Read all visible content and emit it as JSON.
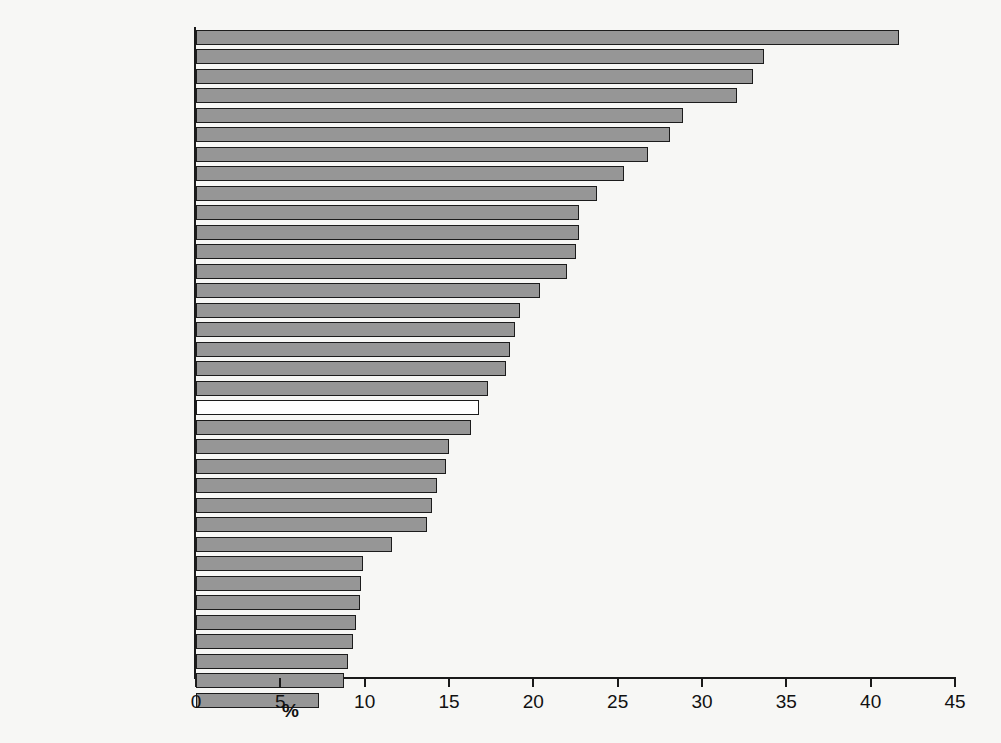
{
  "chart_data": {
    "type": "bar",
    "orientation": "horizontal",
    "title": "",
    "subtitle": "",
    "xlabel": "%",
    "ylabel": "",
    "xlim": [
      0,
      45
    ],
    "xticks": [
      0,
      5,
      10,
      15,
      20,
      25,
      30,
      35,
      40,
      45
    ],
    "xtick_labels": [
      "0",
      "5",
      "10",
      "15",
      "20",
      "25",
      "30",
      "35",
      "40",
      "45"
    ],
    "grid": false,
    "legend": null,
    "bar_fill_color": "#969696",
    "bar_edge_color": "#1c1c1c",
    "highlight_fill_color": "#ffffff",
    "highlight_category": "OECD",
    "background_color": "#f7f7f5",
    "categories": [
      "Spain",
      "Slovak Republic",
      "Greece",
      "Estonia",
      "Ireland",
      "Italy",
      "Hungary",
      "Sweden",
      "Poland",
      "France",
      "Belgium",
      "Portugal",
      "Turkey",
      "Finland",
      "United Kingdom",
      "Chile",
      "United States",
      "Czech Republic",
      "New Zealand",
      "OECD",
      "Iceland",
      "Canada",
      "Slovenia",
      "Luxembourg",
      "Denmark",
      "Israel",
      "Australia",
      "Korea, Rep.",
      "Germany",
      "Mexico",
      "Norway",
      "Japan",
      "Austria",
      "Netherlands",
      "Switzerland"
    ],
    "values": [
      41.7,
      33.7,
      33.0,
      32.1,
      28.9,
      28.1,
      26.8,
      25.4,
      23.8,
      22.7,
      22.7,
      22.5,
      22.0,
      20.4,
      19.2,
      18.9,
      18.6,
      18.4,
      17.3,
      16.8,
      16.3,
      15.0,
      14.8,
      14.3,
      14.0,
      13.7,
      11.6,
      9.9,
      9.8,
      9.7,
      9.5,
      9.3,
      9.0,
      8.8,
      7.3
    ]
  }
}
